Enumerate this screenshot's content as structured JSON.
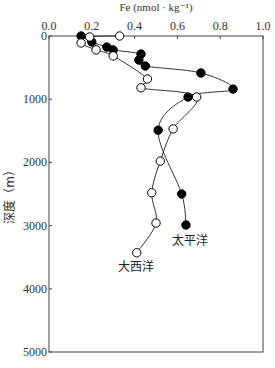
{
  "chart_data": {
    "type": "line",
    "title": "Fe (nmol · kg⁻¹)",
    "xlabel": "Fe (nmol · kg⁻¹)",
    "ylabel": "深度（m）",
    "xlim": [
      0.0,
      1.0
    ],
    "ylim": [
      0,
      5000
    ],
    "y_inverted": true,
    "x_axis_position": "top",
    "x_ticks": [
      "0.0",
      "0.2",
      "0.4",
      "0.6",
      "0.8",
      "1.0"
    ],
    "y_ticks": [
      "0",
      "1000",
      "2000",
      "3000",
      "4000",
      "5000"
    ],
    "grid": false,
    "legend": "inline annotations",
    "series": [
      {
        "name": "太平洋",
        "marker": "filled-circle",
        "color": "#000000",
        "points": [
          {
            "x": 0.15,
            "y": 0
          },
          {
            "x": 0.2,
            "y": 95
          },
          {
            "x": 0.27,
            "y": 175
          },
          {
            "x": 0.3,
            "y": 220
          },
          {
            "x": 0.43,
            "y": 285
          },
          {
            "x": 0.42,
            "y": 380
          },
          {
            "x": 0.45,
            "y": 475
          },
          {
            "x": 0.71,
            "y": 585
          },
          {
            "x": 0.86,
            "y": 840
          },
          {
            "x": 0.65,
            "y": 965
          },
          {
            "x": 0.51,
            "y": 1490
          },
          {
            "x": 0.62,
            "y": 2500
          },
          {
            "x": 0.64,
            "y": 2990
          }
        ]
      },
      {
        "name": "大西洋",
        "marker": "open-circle",
        "color": "#000000",
        "points": [
          {
            "x": 0.33,
            "y": 0
          },
          {
            "x": 0.19,
            "y": 15
          },
          {
            "x": 0.15,
            "y": 110
          },
          {
            "x": 0.22,
            "y": 220
          },
          {
            "x": 0.3,
            "y": 315
          },
          {
            "x": 0.46,
            "y": 680
          },
          {
            "x": 0.43,
            "y": 820
          },
          {
            "x": 0.69,
            "y": 965
          },
          {
            "x": 0.58,
            "y": 1470
          },
          {
            "x": 0.52,
            "y": 1980
          },
          {
            "x": 0.48,
            "y": 2480
          },
          {
            "x": 0.5,
            "y": 2960
          },
          {
            "x": 0.41,
            "y": 3430
          }
        ]
      }
    ],
    "annotations": [
      {
        "text": "太平洋",
        "near_series": "太平洋"
      },
      {
        "text": "大西洋",
        "near_series": "大西洋"
      }
    ]
  }
}
